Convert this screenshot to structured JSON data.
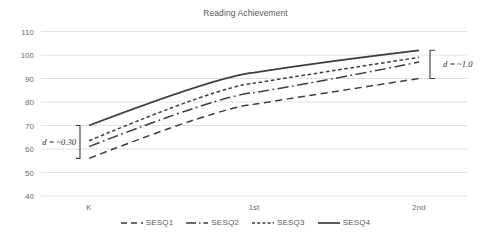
{
  "chart_data": {
    "type": "line",
    "title": "Reading Achievement",
    "xlabel": "",
    "ylabel": "",
    "x": [
      "K",
      "1st",
      "2nd"
    ],
    "categories": [
      "K",
      "1st",
      "2nd"
    ],
    "ylim": [
      40,
      110
    ],
    "yticks": [
      40,
      50,
      60,
      70,
      80,
      90,
      100,
      110
    ],
    "ytick_labels": [
      "40",
      "50",
      "60",
      "70",
      "80",
      "90",
      "100",
      "110"
    ],
    "grid": true,
    "legend_position": "bottom",
    "series": [
      {
        "name": "SESQ1",
        "style": "dashed",
        "values": [
          56.0,
          79.0,
          90.0
        ]
      },
      {
        "name": "SESQ2",
        "style": "dashdot",
        "values": [
          61.0,
          84.0,
          97.0
        ]
      },
      {
        "name": "SESQ3",
        "style": "dotted",
        "values": [
          63.5,
          88.0,
          99.0
        ]
      },
      {
        "name": "SESQ4",
        "style": "solid",
        "values": [
          70.0,
          92.5,
          102.0
        ]
      }
    ],
    "annotations": [
      {
        "id": "d-left",
        "label_prefix": "d",
        "label": "d = ~0.30",
        "value": "~0.30",
        "at_x": "K",
        "bracket_from": 56.0,
        "bracket_to": 70.0,
        "side": "left"
      },
      {
        "id": "d-right",
        "label_prefix": "d",
        "label": "d = ~1.0",
        "value": "~1.0",
        "at_x": "2nd",
        "bracket_from": 90.0,
        "bracket_to": 102.0,
        "side": "right"
      }
    ],
    "colors": {
      "line": "#3d3d3d",
      "grid": "#d9d9d9",
      "text": "#595959",
      "background": "#ffffff"
    }
  },
  "legend": {
    "items": [
      {
        "label": "SESQ1"
      },
      {
        "label": "SESQ2"
      },
      {
        "label": "SESQ3"
      },
      {
        "label": "SESQ4"
      }
    ]
  },
  "axis": {
    "y_labels": [
      "110",
      "100",
      "90",
      "80",
      "70",
      "60",
      "50",
      "40"
    ],
    "x_labels": [
      "K",
      "1st",
      "2nd"
    ]
  },
  "annotations": {
    "left": {
      "text": "d = ~0.30"
    },
    "right": {
      "text": "d = ~1.0"
    }
  }
}
